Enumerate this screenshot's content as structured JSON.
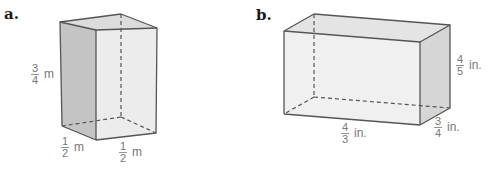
{
  "figures": [
    {
      "id": "a",
      "label": "a.",
      "shape": "rectangular prism",
      "dimensions": {
        "height": {
          "numerator": "3",
          "denominator": "4",
          "unit": "m"
        },
        "depth": {
          "numerator": "1",
          "denominator": "2",
          "unit": "m"
        },
        "width": {
          "numerator": "1",
          "denominator": "2",
          "unit": "m"
        }
      },
      "colors": {
        "side_face": "#c4c4c4",
        "front_face": "#ececec",
        "top_face": "#dcdcdc"
      }
    },
    {
      "id": "b",
      "label": "b.",
      "shape": "rectangular prism",
      "dimensions": {
        "height": {
          "numerator": "4",
          "denominator": "5",
          "unit": "in."
        },
        "length": {
          "numerator": "4",
          "denominator": "3",
          "unit": "in."
        },
        "depth": {
          "numerator": "3",
          "denominator": "4",
          "unit": "in."
        }
      },
      "colors": {
        "side_face": "#d6d6d6",
        "front_face": "#f0f0f0",
        "top_face": "#e4e4e4"
      }
    }
  ]
}
